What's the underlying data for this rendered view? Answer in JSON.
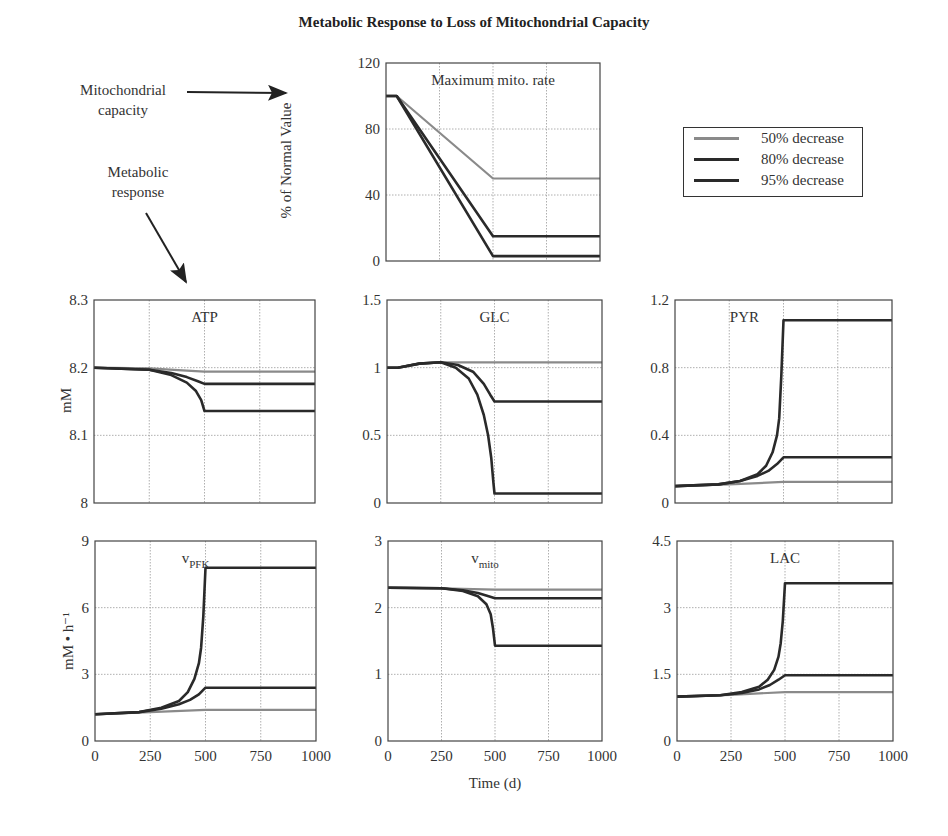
{
  "figure": {
    "title": "Metabolic Response to Loss of Mitochondrial Capacity",
    "annotations": {
      "mito_capacity": [
        "Mitochondrial",
        "capacity"
      ],
      "metabolic_response": [
        "Metabolic",
        "response"
      ]
    },
    "shared_xlabel": "Time (d)",
    "ylabel_top": "% of Normal Value",
    "ylabel_row1": "mM",
    "ylabel_row2": "mM • h⁻¹",
    "legend": [
      {
        "label": "50% decrease",
        "color": "#8a8a8a"
      },
      {
        "label": "80% decrease",
        "color": "#2a2a2a"
      },
      {
        "label": "95% decrease",
        "color": "#2a2a2a"
      }
    ]
  },
  "chart_data": [
    {
      "type": "line",
      "id": "mito",
      "title": "Maximum mito. rate",
      "ylabel": "% of Normal Value",
      "xlabel": "",
      "xlim": [
        0,
        1000
      ],
      "ylim": [
        0,
        120
      ],
      "xticks": [
        0,
        250,
        500,
        750,
        1000
      ],
      "yticks": [
        0,
        40,
        80,
        120
      ],
      "show_xticklabels": false,
      "grid": true,
      "box": {
        "x": 386,
        "y": 63,
        "w": 214,
        "h": 198
      },
      "series": [
        {
          "name": "50% decrease",
          "x": [
            0,
            50,
            500,
            1000
          ],
          "y": [
            100,
            100,
            50,
            50
          ]
        },
        {
          "name": "80% decrease",
          "x": [
            0,
            50,
            500,
            1000
          ],
          "y": [
            100,
            100,
            15,
            15
          ]
        },
        {
          "name": "95% decrease",
          "x": [
            0,
            50,
            500,
            1000
          ],
          "y": [
            100,
            100,
            3,
            3
          ]
        }
      ]
    },
    {
      "type": "line",
      "id": "atp",
      "title": "ATP",
      "ylabel": "mM",
      "xlim": [
        0,
        1000
      ],
      "ylim": [
        8,
        8.3
      ],
      "xticks": [
        0,
        250,
        500,
        750,
        1000
      ],
      "yticks": [
        8,
        8.1,
        8.2,
        8.3
      ],
      "show_xticklabels": false,
      "grid": true,
      "box": {
        "x": 94,
        "y": 300,
        "w": 221,
        "h": 203
      },
      "series": [
        {
          "name": "50% decrease",
          "x": [
            0,
            250,
            400,
            500,
            1000
          ],
          "y": [
            8.2,
            8.199,
            8.196,
            8.194,
            8.194
          ]
        },
        {
          "name": "80% decrease",
          "x": [
            0,
            250,
            350,
            420,
            470,
            500,
            1000
          ],
          "y": [
            8.2,
            8.197,
            8.192,
            8.186,
            8.18,
            8.176,
            8.176
          ]
        },
        {
          "name": "95% decrease",
          "x": [
            0,
            250,
            350,
            420,
            460,
            485,
            500,
            1000
          ],
          "y": [
            8.2,
            8.197,
            8.189,
            8.178,
            8.166,
            8.152,
            8.136,
            8.136
          ]
        }
      ]
    },
    {
      "type": "line",
      "id": "glc",
      "title": "GLC",
      "ylabel": "",
      "xlim": [
        0,
        1000
      ],
      "ylim": [
        0,
        1.5
      ],
      "xticks": [
        0,
        250,
        500,
        750,
        1000
      ],
      "yticks": [
        0,
        0.5,
        1,
        1.5
      ],
      "show_xticklabels": false,
      "grid": true,
      "box": {
        "x": 387,
        "y": 300,
        "w": 215,
        "h": 203
      },
      "series": [
        {
          "name": "50% decrease",
          "x": [
            0,
            50,
            150,
            250,
            500,
            1000
          ],
          "y": [
            1.0,
            1.0,
            1.03,
            1.04,
            1.04,
            1.04
          ]
        },
        {
          "name": "80% decrease",
          "x": [
            0,
            50,
            150,
            250,
            330,
            400,
            450,
            480,
            500,
            1000
          ],
          "y": [
            1.0,
            1.0,
            1.03,
            1.04,
            1.02,
            0.97,
            0.88,
            0.8,
            0.75,
            0.75
          ]
        },
        {
          "name": "95% decrease",
          "x": [
            0,
            50,
            150,
            250,
            320,
            380,
            420,
            450,
            470,
            485,
            495,
            500,
            1000
          ],
          "y": [
            1.0,
            1.0,
            1.03,
            1.04,
            1.0,
            0.92,
            0.8,
            0.65,
            0.5,
            0.33,
            0.15,
            0.07,
            0.07
          ]
        }
      ]
    },
    {
      "type": "line",
      "id": "pyr",
      "title": "PYR",
      "ylabel": "",
      "xlim": [
        0,
        1000
      ],
      "ylim": [
        0,
        1.2
      ],
      "xticks": [
        0,
        250,
        500,
        750,
        1000
      ],
      "yticks": [
        0,
        0.4,
        0.8,
        1.2
      ],
      "show_xticklabels": false,
      "grid": true,
      "box": {
        "x": 675,
        "y": 300,
        "w": 217,
        "h": 203
      },
      "series": [
        {
          "name": "50% decrease",
          "x": [
            0,
            250,
            500,
            1000
          ],
          "y": [
            0.1,
            0.11,
            0.125,
            0.125
          ]
        },
        {
          "name": "80% decrease",
          "x": [
            0,
            200,
            300,
            380,
            430,
            470,
            500,
            1000
          ],
          "y": [
            0.1,
            0.11,
            0.13,
            0.16,
            0.19,
            0.23,
            0.27,
            0.27
          ]
        },
        {
          "name": "95% decrease",
          "x": [
            0,
            200,
            300,
            380,
            420,
            450,
            470,
            480,
            490,
            500,
            1000
          ],
          "y": [
            0.1,
            0.11,
            0.13,
            0.17,
            0.22,
            0.3,
            0.4,
            0.5,
            0.75,
            1.08,
            1.08
          ]
        }
      ]
    },
    {
      "type": "line",
      "id": "vpfk",
      "title": "v_PFK",
      "title_main": "v",
      "title_sub": "PFK",
      "ylabel": "mM • h⁻¹",
      "xlim": [
        0,
        1000
      ],
      "ylim": [
        0,
        9
      ],
      "xticks": [
        0,
        250,
        500,
        750,
        1000
      ],
      "yticks": [
        0,
        3,
        6,
        9
      ],
      "show_xticklabels": true,
      "grid": true,
      "box": {
        "x": 95,
        "y": 541,
        "w": 221,
        "h": 200
      },
      "series": [
        {
          "name": "50% decrease",
          "x": [
            0,
            250,
            500,
            1000
          ],
          "y": [
            1.2,
            1.3,
            1.4,
            1.4
          ]
        },
        {
          "name": "80% decrease",
          "x": [
            0,
            200,
            300,
            380,
            430,
            470,
            500,
            1000
          ],
          "y": [
            1.2,
            1.3,
            1.45,
            1.65,
            1.85,
            2.1,
            2.4,
            2.4
          ]
        },
        {
          "name": "95% decrease",
          "x": [
            0,
            200,
            300,
            380,
            420,
            450,
            470,
            480,
            490,
            500,
            1000
          ],
          "y": [
            1.2,
            1.3,
            1.5,
            1.8,
            2.2,
            2.8,
            3.5,
            4.2,
            5.6,
            7.8,
            7.8
          ]
        }
      ]
    },
    {
      "type": "line",
      "id": "vmito",
      "title": "v_mito",
      "title_main": "v",
      "title_sub": "mito",
      "ylabel": "",
      "xlim": [
        0,
        1000
      ],
      "ylim": [
        0,
        3
      ],
      "xticks": [
        0,
        250,
        500,
        750,
        1000
      ],
      "yticks": [
        0,
        1,
        2,
        3
      ],
      "show_xticklabels": true,
      "grid": true,
      "box": {
        "x": 388,
        "y": 541,
        "w": 214,
        "h": 200
      },
      "series": [
        {
          "name": "50% decrease",
          "x": [
            0,
            250,
            500,
            1000
          ],
          "y": [
            2.3,
            2.29,
            2.27,
            2.27
          ]
        },
        {
          "name": "80% decrease",
          "x": [
            0,
            250,
            350,
            420,
            470,
            500,
            1000
          ],
          "y": [
            2.3,
            2.29,
            2.26,
            2.22,
            2.17,
            2.14,
            2.14
          ]
        },
        {
          "name": "95% decrease",
          "x": [
            0,
            250,
            350,
            420,
            460,
            480,
            490,
            500,
            1000
          ],
          "y": [
            2.3,
            2.29,
            2.25,
            2.17,
            2.05,
            1.9,
            1.7,
            1.43,
            1.43
          ]
        }
      ]
    },
    {
      "type": "line",
      "id": "lac",
      "title": "LAC",
      "ylabel": "",
      "xlim": [
        0,
        1000
      ],
      "ylim": [
        0,
        4.5
      ],
      "xticks": [
        0,
        250,
        500,
        750,
        1000
      ],
      "yticks": [
        0,
        1.5,
        3,
        4.5
      ],
      "show_xticklabels": true,
      "grid": true,
      "box": {
        "x": 677,
        "y": 541,
        "w": 216,
        "h": 200
      },
      "series": [
        {
          "name": "50% decrease",
          "x": [
            0,
            250,
            500,
            1000
          ],
          "y": [
            1.0,
            1.04,
            1.1,
            1.1
          ]
        },
        {
          "name": "80% decrease",
          "x": [
            0,
            200,
            300,
            380,
            430,
            470,
            500,
            1000
          ],
          "y": [
            1.0,
            1.03,
            1.08,
            1.16,
            1.26,
            1.38,
            1.48,
            1.48
          ]
        },
        {
          "name": "95% decrease",
          "x": [
            0,
            200,
            300,
            380,
            420,
            450,
            470,
            480,
            490,
            500,
            1000
          ],
          "y": [
            1.0,
            1.03,
            1.1,
            1.22,
            1.38,
            1.6,
            1.9,
            2.2,
            2.7,
            3.55,
            3.55
          ]
        }
      ]
    }
  ]
}
